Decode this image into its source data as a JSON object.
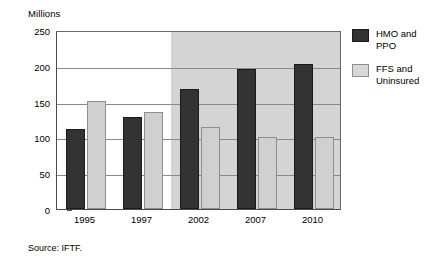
{
  "chart_data": {
    "type": "bar",
    "title": "",
    "subtitle": "",
    "ylabel": "Millions",
    "xlabel": "",
    "categories": [
      "1995",
      "1997",
      "2002",
      "2007",
      "2010"
    ],
    "series": [
      {
        "name": "HMO and PPO",
        "values": [
          112,
          128,
          168,
          196,
          202
        ],
        "color": "#333333"
      },
      {
        "name": "FFS and Uninsured",
        "values": [
          151,
          135,
          115,
          100,
          100
        ],
        "color": "#d0d0d0"
      }
    ],
    "ylim": [
      0,
      250
    ],
    "ytick_labels": [
      "250",
      "200",
      "150",
      "100",
      "50",
      "0"
    ],
    "ytick_values": [
      250,
      200,
      150,
      100,
      50,
      0
    ],
    "grid": true,
    "legend_position": "right",
    "annotations": [
      {
        "type": "shaded-region",
        "label": "forecast",
        "from_category_index": 2,
        "color": "#d4d4d4"
      }
    ],
    "source": "Source: IFTF."
  },
  "legend": {
    "items": [
      {
        "label": "HMO and\nPPO",
        "swatch": "hmo"
      },
      {
        "label": "FFS and\nUninsured",
        "swatch": "ffs"
      }
    ]
  },
  "footer": {
    "source": "Source: IFTF."
  }
}
